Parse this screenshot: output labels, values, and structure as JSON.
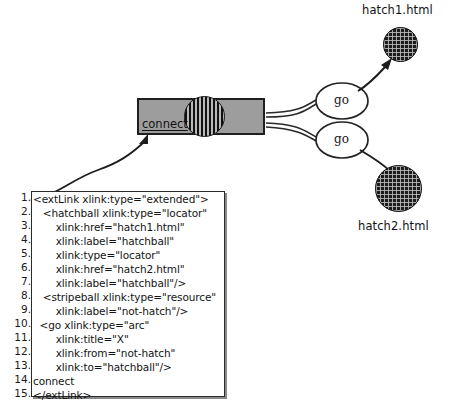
{
  "diagram": {
    "colors": {
      "connect_box_fill": "#9d9d9d",
      "outline": "#1f1f1f",
      "hatch_fill": "#1c1c1c",
      "page_background": "#ffffff"
    },
    "nodes": {
      "connect_box": {
        "label": "connect",
        "shape": "rectangle",
        "fill": "#9d9d9d"
      },
      "stripeball": {
        "name": "stripeball",
        "shape": "striped-circle"
      },
      "go_arcs": [
        {
          "label": "go",
          "shape": "ellipse"
        },
        {
          "label": "go",
          "shape": "ellipse"
        }
      ],
      "hatchballs": [
        {
          "label": "hatch1.html",
          "shape": "hatched-circle"
        },
        {
          "label": "hatch2.html",
          "shape": "hatched-circle"
        }
      ]
    }
  },
  "code": {
    "line_numbers": [
      "1.",
      "2.",
      "3.",
      "4.",
      "5.",
      "6.",
      "7.",
      "8.",
      "9.",
      "10.",
      "11.",
      "12.",
      "13.",
      "14.",
      "15."
    ],
    "lines": [
      "<extLink xlink:type=\"extended\">",
      "   <hatchball xlink:type=\"locator\"",
      "       xlink:href=\"hatch1.html\"",
      "       xlink:label=\"hatchball\"",
      "       xlink:type=\"locator\"",
      "       xlink:href=\"hatch2.html\"",
      "       xlink:label=\"hatchball\"/>",
      "   <stripeball xlink:type=\"resource\"",
      "       xlink:label=\"not-hatch\"/>",
      "  <go xlink:type=\"arc\"",
      "       xlink:title=\"X\"",
      "       xlink:from=\"not-hatch\"",
      "       xlink:to=\"hatchball\"/>",
      "connect",
      "</extLink>"
    ]
  }
}
